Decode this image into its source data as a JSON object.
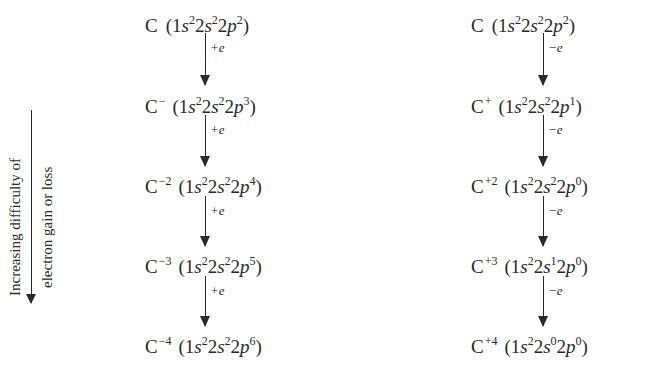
{
  "side_annotation": {
    "line1": "Increasing difficulty of",
    "line2": "electron gain or loss"
  },
  "gain_column": {
    "step_label": "+e",
    "species": [
      {
        "symbol": "C",
        "charge": "",
        "s1": "2",
        "s2": "2",
        "p2": "2"
      },
      {
        "symbol": "C",
        "charge": "−",
        "s1": "2",
        "s2": "2",
        "p2": "3"
      },
      {
        "symbol": "C",
        "charge": "−2",
        "s1": "2",
        "s2": "2",
        "p2": "4"
      },
      {
        "symbol": "C",
        "charge": "−3",
        "s1": "2",
        "s2": "2",
        "p2": "5"
      },
      {
        "symbol": "C",
        "charge": "−4",
        "s1": "2",
        "s2": "2",
        "p2": "6"
      }
    ]
  },
  "loss_column": {
    "step_label": "−e",
    "species": [
      {
        "symbol": "C",
        "charge": "",
        "s1": "2",
        "s2": "2",
        "p2": "2"
      },
      {
        "symbol": "C",
        "charge": "+",
        "s1": "2",
        "s2": "2",
        "p2": "1"
      },
      {
        "symbol": "C",
        "charge": "+2",
        "s1": "2",
        "s2": "2",
        "p2": "0"
      },
      {
        "symbol": "C",
        "charge": "+3",
        "s1": "2",
        "s2": "1",
        "p2": "0"
      },
      {
        "symbol": "C",
        "charge": "+4",
        "s1": "2",
        "s2": "0",
        "p2": "0"
      }
    ]
  },
  "orbital_labels": {
    "n1": "1",
    "n2": "2",
    "s": "s",
    "p": "p",
    "open": "(",
    "close": ")"
  }
}
